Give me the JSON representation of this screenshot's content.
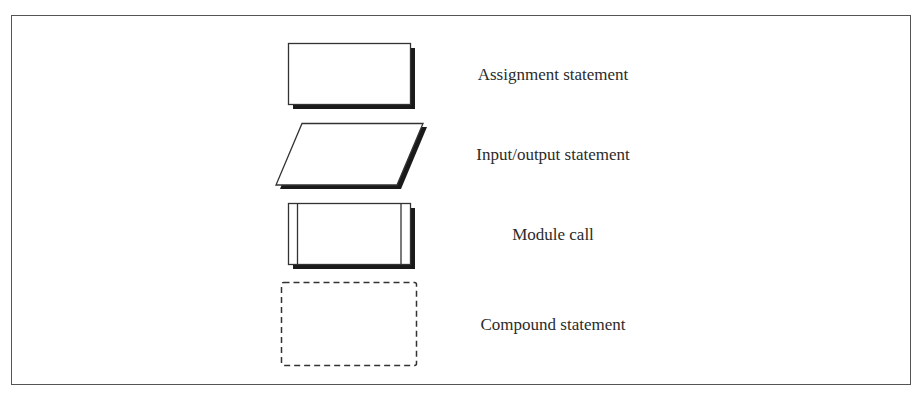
{
  "diagram": {
    "type": "flowchart-symbol-legend",
    "colors": {
      "stroke": "#333333",
      "shadow": "#1a1a1a",
      "fill": "#ffffff",
      "frame": "#555555"
    },
    "symbols": [
      {
        "id": "assignment",
        "shape": "shadowed-rectangle",
        "label": "Assignment statement"
      },
      {
        "id": "input-output",
        "shape": "shadowed-parallelogram",
        "label": "Input/output statement"
      },
      {
        "id": "module-call",
        "shape": "shadowed-rectangle-with-side-bars",
        "label": "Module call"
      },
      {
        "id": "compound",
        "shape": "dashed-rectangle",
        "label": "Compound statement"
      }
    ]
  }
}
